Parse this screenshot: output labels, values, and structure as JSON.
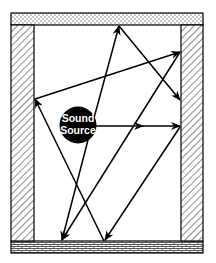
{
  "diagram": {
    "type": "room-acoustics-reflection",
    "source": {
      "label_line1": "Sound",
      "label_line2": "Source",
      "fill": "#000000",
      "text_color": "#ffffff"
    },
    "surfaces": {
      "ceiling": "dotted-hatch",
      "floor": "brick-pattern",
      "left_wall": "diagonal-hatch",
      "right_wall": "diagonal-hatch"
    },
    "colors": {
      "line": "#000000",
      "background": "#ffffff",
      "hatch": "#555555"
    }
  }
}
